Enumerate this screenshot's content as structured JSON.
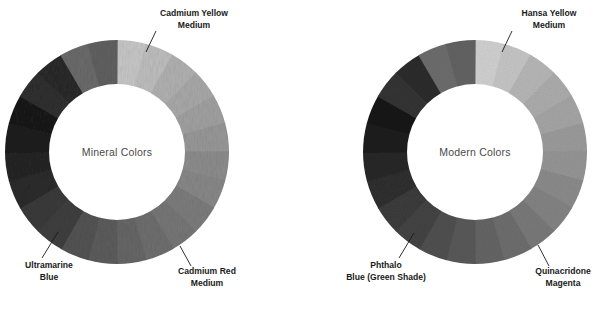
{
  "figure": {
    "background_color": "#ffffff",
    "wheel_count": 2,
    "segments_per_wheel": 12
  },
  "wheels": [
    {
      "id": "mineral-colors-wheel",
      "center_label": "Mineral Colors",
      "cx": 117,
      "cy": 152,
      "outer_r": 112,
      "inner_r": 68,
      "start_angle": -90,
      "segment_shades": [
        "#c6c6c6",
        "#b0b0b0",
        "#a0a0a0",
        "#8c8c8c",
        "#7c7c7c",
        "#6e6e6e",
        "#5c5c5c",
        "#3f3f3f",
        "#2b2b2b",
        "#1f1f1f",
        "#2f2f2f",
        "#6a6a6a"
      ],
      "segment_shades_alt": [
        "#bdbdbd",
        "#a8a8a8",
        "#979797",
        "#878787",
        "#767676",
        "#666666",
        "#535353",
        "#3a3a3a",
        "#252525",
        "#1a1a1a",
        "#2a2a2a",
        "#606060"
      ],
      "callouts": [
        {
          "name": "cadmium-yellow-medium",
          "line1": "Cadmium Yellow",
          "line2": "Medium",
          "text_x": 146,
          "text_y": 10,
          "leader": {
            "x1": 156,
            "y1": 31,
            "x2": 146,
            "y2": 52
          }
        },
        {
          "name": "cadmium-red-medium",
          "line1": "Cadmium Red",
          "line2": "Medium",
          "text_x": 163,
          "text_y": 268,
          "leader": {
            "x1": 191,
            "y1": 266,
            "x2": 180,
            "y2": 246
          }
        },
        {
          "name": "ultramarine-blue",
          "line1": "Ultramarine",
          "line2": "Blue",
          "text_x": 9,
          "text_y": 262,
          "leader": {
            "x1": 42,
            "y1": 258,
            "x2": 58,
            "y2": 232
          }
        }
      ]
    },
    {
      "id": "modern-colors-wheel",
      "center_label": "Modern Colors",
      "cx": 475,
      "cy": 152,
      "outer_r": 112,
      "inner_r": 68,
      "start_angle": -90,
      "segment_shades": [
        "#cfcfcf",
        "#b5b5b5",
        "#a4a4a4",
        "#949494",
        "#828282",
        "#6d6d6d",
        "#585858",
        "#434343",
        "#2e2e2e",
        "#1e1e1e",
        "#343434",
        "#6c6c6c"
      ],
      "segment_shades_alt": [
        "#c4c4c4",
        "#ababab",
        "#9a9a9a",
        "#8a8a8a",
        "#787878",
        "#646464",
        "#4f4f4f",
        "#3b3b3b",
        "#272727",
        "#191919",
        "#2d2d2d",
        "#626262"
      ],
      "callouts": [
        {
          "name": "hansa-yellow-medium",
          "line1": "Hansa Yellow",
          "line2": "Medium",
          "text_x": 503,
          "text_y": 10,
          "leader": {
            "x1": 512,
            "y1": 31,
            "x2": 502,
            "y2": 52
          }
        },
        {
          "name": "quinacridone-magenta",
          "line1": "Quinacridone",
          "line2": "Magenta",
          "text_x": 522,
          "text_y": 268,
          "leader": {
            "x1": 549,
            "y1": 266,
            "x2": 538,
            "y2": 245
          }
        },
        {
          "name": "phthalo-blue-green-shade",
          "line1": "Phthalo",
          "line2": "Blue (Green Shade)",
          "text_x": 326,
          "text_y": 262,
          "leader": {
            "x1": 399,
            "y1": 258,
            "x2": 414,
            "y2": 233
          }
        }
      ]
    }
  ]
}
